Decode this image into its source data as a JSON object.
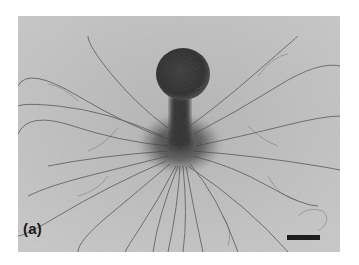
{
  "figure": {
    "panel_label": "(a)",
    "colors": {
      "background": "#bdbdbd",
      "body": "#2a2a2a",
      "filaments": "#4a4a4a",
      "scale_bar": "#1e1e1e"
    },
    "scale_bar": {
      "label": ""
    }
  }
}
